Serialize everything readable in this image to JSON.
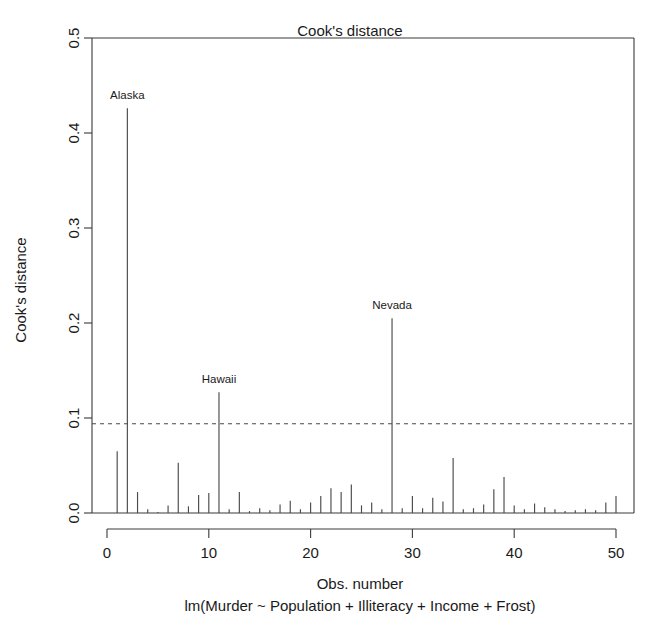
{
  "chart_data": {
    "type": "bar",
    "title": "Cook's distance",
    "xlabel": "Obs. number",
    "ylabel": "Cook's distance",
    "caption": "lm(Murder ~ Population + Illiteracy + Income + Frost)",
    "xlim": [
      0,
      51
    ],
    "ylim": [
      0.0,
      0.5
    ],
    "grid": false,
    "legend": "none",
    "xticks": [
      0,
      10,
      20,
      30,
      40,
      50
    ],
    "xtick_labels": [
      "0",
      "10",
      "20",
      "30",
      "40",
      "50"
    ],
    "yticks": [
      0.0,
      0.1,
      0.2,
      0.3,
      0.4,
      0.5
    ],
    "ytick_labels": [
      "0.0",
      "0.1",
      "0.2",
      "0.3",
      "0.4",
      "0.5"
    ],
    "threshold": {
      "value": 0.094,
      "style": "dashed",
      "label": "cutoff"
    },
    "categories": [
      1,
      2,
      3,
      4,
      5,
      6,
      7,
      8,
      9,
      10,
      11,
      12,
      13,
      14,
      15,
      16,
      17,
      18,
      19,
      20,
      21,
      22,
      23,
      24,
      25,
      26,
      27,
      28,
      29,
      30,
      31,
      32,
      33,
      34,
      35,
      36,
      37,
      38,
      39,
      40,
      41,
      42,
      43,
      44,
      45,
      46,
      47,
      48,
      49,
      50
    ],
    "values": [
      0.065,
      0.426,
      0.022,
      0.004,
      0.001,
      0.008,
      0.053,
      0.007,
      0.019,
      0.021,
      0.127,
      0.004,
      0.022,
      0.002,
      0.005,
      0.003,
      0.009,
      0.013,
      0.004,
      0.011,
      0.018,
      0.026,
      0.022,
      0.03,
      0.008,
      0.011,
      0.004,
      0.205,
      0.005,
      0.018,
      0.005,
      0.016,
      0.012,
      0.058,
      0.004,
      0.005,
      0.009,
      0.025,
      0.038,
      0.008,
      0.004,
      0.01,
      0.006,
      0.004,
      0.002,
      0.003,
      0.004,
      0.003,
      0.011,
      0.018
    ],
    "annotations": [
      {
        "label": "Alaska",
        "obs": 2,
        "value": 0.426
      },
      {
        "label": "Hawaii",
        "obs": 11,
        "value": 0.127
      },
      {
        "label": "Nevada",
        "obs": 28,
        "value": 0.205
      }
    ],
    "colors": {
      "bar": "#4a4a4a",
      "axis": "#3a3a3a",
      "threshold": "#4a4a4a",
      "background": "#ffffff",
      "text": "#1a1a1a"
    }
  }
}
